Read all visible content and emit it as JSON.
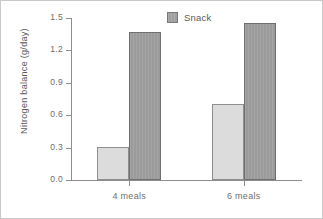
{
  "chart_data": {
    "type": "bar",
    "title": "",
    "subtitle": "",
    "xlabel": "",
    "ylabel": "Nitrogen balance (g/day)",
    "categories": [
      "4 meals",
      "6 meals"
    ],
    "series": [
      {
        "name": "",
        "values": [
          0.31,
          0.7
        ],
        "color": "#dcdcdc"
      },
      {
        "name": "Snack",
        "values": [
          1.37,
          1.45
        ],
        "color": "#9b9b9b"
      }
    ],
    "ylim": [
      0.0,
      1.5
    ],
    "ytick_labels": [
      "1.5",
      "1.2",
      "0.9",
      "0.6",
      "0.3",
      "0.0"
    ],
    "ytick_values": [
      1.5,
      1.2,
      0.9,
      0.6,
      0.3,
      0.0
    ],
    "grid": false,
    "legend": {
      "position": "top-center",
      "entries": [
        {
          "label": "Snack",
          "swatch_color": "#9b9b9b"
        }
      ]
    },
    "annotations": []
  },
  "figure": {
    "background_color": "#ffffff",
    "border_color": "#c9c9c9",
    "axis_color": "#8d8d8d",
    "text_color": "#6d6d6d"
  }
}
